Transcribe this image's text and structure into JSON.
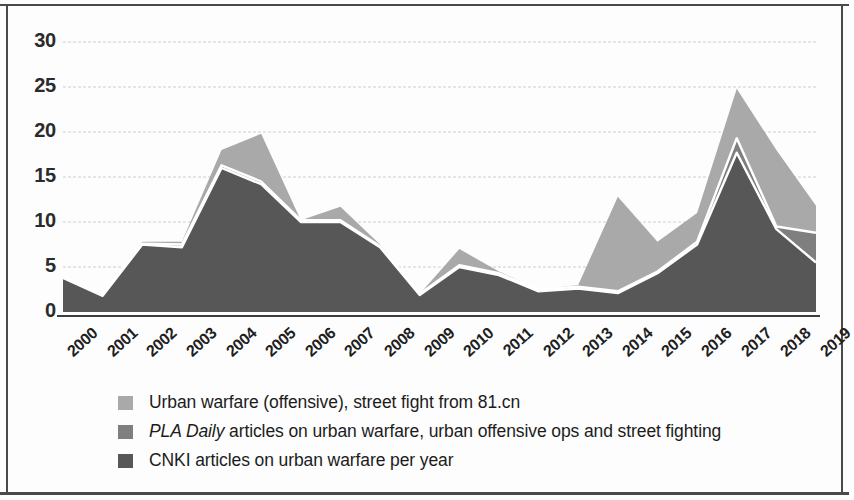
{
  "chart_data": {
    "type": "area",
    "title": "",
    "subtitle": "",
    "xlabel": "",
    "ylabel": "",
    "ylim": [
      0,
      30
    ],
    "yticks": [
      0,
      5,
      10,
      15,
      20,
      25,
      30
    ],
    "grid": true,
    "legend_position": "bottom-left",
    "stacked": false,
    "overlaid": true,
    "categories": [
      "2000",
      "2001",
      "2002",
      "2003",
      "2004",
      "2005",
      "2006",
      "2007",
      "2008",
      "2009",
      "2010",
      "2011",
      "2012",
      "2013",
      "2014",
      "2015",
      "2016",
      "2017",
      "2018",
      "2019"
    ],
    "series": [
      {
        "name": "Urban warfare (offensive), street fight from 81.cn",
        "color": "#a9a9a9",
        "values": [
          4,
          2,
          7.8,
          7.8,
          18,
          19.8,
          10.2,
          11.7,
          7.5,
          2,
          7,
          4.5,
          2.5,
          3,
          12.8,
          7.8,
          11,
          24.8,
          18,
          11.8
        ]
      },
      {
        "name": "PLA Daily articles on urban warfare, urban offensive ops and street fighting",
        "color": "#7f7f7f",
        "values": [
          4,
          2,
          7.6,
          7.5,
          16.3,
          14.5,
          10.2,
          10.2,
          7.3,
          2,
          5.2,
          4.3,
          2.5,
          2.8,
          2.3,
          4.5,
          7.8,
          19.3,
          9.5,
          8.8
        ]
      },
      {
        "name": "CNKI articles on urban warfare per year",
        "color": "#575757",
        "values": [
          3.8,
          1.8,
          7.5,
          7.2,
          16,
          14.2,
          10,
          10,
          7.2,
          1.9,
          5,
          4.1,
          2.3,
          2.6,
          2.1,
          4.3,
          7.5,
          17.7,
          9.2,
          5.5
        ]
      }
    ]
  },
  "axis": {
    "y_tick_labels": [
      "30",
      "25",
      "20",
      "15",
      "10",
      "5",
      "0"
    ],
    "x_tick_labels": [
      "2000",
      "2001",
      "2002",
      "2003",
      "2004",
      "2005",
      "2006",
      "2007",
      "2008",
      "2009",
      "2010",
      "2011",
      "2012",
      "2013",
      "2014",
      "2015",
      "2016",
      "2017",
      "2018",
      "2019"
    ]
  },
  "legend": {
    "items": [
      {
        "swatch_color": "#a9a9a9",
        "label": "Urban warfare (offensive), street fight from 81.cn",
        "italic_prefix": ""
      },
      {
        "swatch_color": "#7f7f7f",
        "label": " articles on urban warfare, urban offensive ops and street fighting",
        "italic_prefix": "PLA Daily"
      },
      {
        "swatch_color": "#575757",
        "label": "CNKI articles on urban warfare per year",
        "italic_prefix": ""
      }
    ]
  }
}
